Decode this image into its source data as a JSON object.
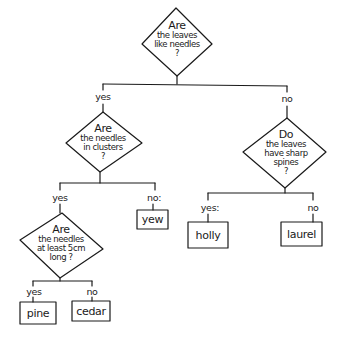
{
  "diagram": {
    "type": "decision-tree",
    "line_color": "#1a1a1a",
    "root": {
      "question": [
        "Are",
        "the leaves",
        "like needles",
        "?"
      ]
    },
    "branches": {
      "root_yes": "yes",
      "root_no": "no"
    },
    "q_clusters": {
      "question": [
        "Are",
        "the needles",
        "in clusters",
        "?"
      ],
      "yes_label": "yes",
      "no_label": "no:"
    },
    "q_length": {
      "question": [
        "Are",
        "the needles",
        "at least 5cm",
        "long ?"
      ],
      "yes_label": "yes",
      "no_label": "no"
    },
    "q_spines": {
      "question": [
        "Do",
        "the leaves",
        "have sharp",
        "spines",
        "?"
      ],
      "yes_label": "yes:",
      "no_label": "no"
    },
    "leaves": {
      "yew": "yew",
      "pine": "pine",
      "cedar": "cedar",
      "holly": "holly",
      "laurel": "laurel"
    }
  }
}
